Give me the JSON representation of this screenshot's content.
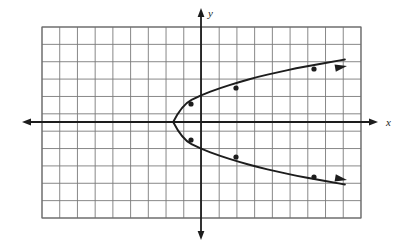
{
  "figure": {
    "background_color": "#ffffff",
    "grid": {
      "left": 42,
      "top": 27,
      "right": 361,
      "bottom": 218,
      "cell_size": 17.72,
      "columns": 18,
      "rows": 11,
      "line_color": "#7a7a7a",
      "line_width": 0.9,
      "border_color": "#6a6a6a",
      "border_width": 1.1,
      "visible": true
    },
    "axes": {
      "x_axis": {
        "label": "x",
        "label_x": 386,
        "label_y": 126,
        "y_pixel": 122,
        "start_x": 22,
        "end_x": 378,
        "color": "#1d1d1d",
        "line_width": 1.8,
        "arrow_left": true,
        "arrow_right": true
      },
      "y_axis": {
        "label": "y",
        "label_x": 208,
        "label_y": 17,
        "x_pixel": 201,
        "start_y": 8,
        "end_y": 240,
        "color": "#1d1d1d",
        "line_width": 1.8,
        "arrow_up": true,
        "arrow_down": true
      },
      "origin_pixel": [
        201,
        122
      ]
    }
  },
  "chart_data": {
    "type": "line",
    "xlabel": "x",
    "ylabel": "y",
    "grid": true,
    "legend": false,
    "curve_color": "#1d1d1d",
    "curve_width": 1.9,
    "vertex_pixel": [
      173,
      122
    ],
    "vertex_data": [
      -1.57,
      0
    ],
    "axis_of_symmetry": "y = 0",
    "opens": "right",
    "x": [
      -1.57,
      -1.07,
      0.0,
      1.06,
      2.15,
      3.21,
      4.29,
      5.37,
      6.46,
      7.57,
      8.12
    ],
    "y_upper": [
      0.0,
      1.0,
      1.55,
      1.95,
      2.3,
      2.6,
      2.85,
      3.1,
      3.3,
      3.5,
      3.6
    ],
    "y_lower": [
      0.0,
      -1.0,
      -1.55,
      -1.95,
      -2.3,
      -2.6,
      -2.85,
      -3.1,
      -3.3,
      -3.5,
      -3.6
    ],
    "marked_points_pixel": [
      [
        191,
        104
      ],
      [
        236,
        88
      ],
      [
        314,
        69
      ],
      [
        191,
        140
      ],
      [
        236,
        157
      ],
      [
        314,
        177
      ]
    ],
    "marked_points_data": [
      [
        -0.56,
        1.02
      ],
      [
        1.97,
        1.92
      ],
      [
        6.38,
        2.99
      ],
      [
        -0.56,
        -1.02
      ],
      [
        1.97,
        -1.92
      ],
      [
        6.38,
        -2.99
      ]
    ],
    "marked_point_radius": 2.6,
    "marked_point_color": "#1d1d1d",
    "upper_arrow_tip_pixel": [
      347,
      66
    ],
    "lower_arrow_tip_pixel": [
      347,
      180
    ],
    "xlim": [
      -8.98,
      9.03
    ],
    "ylim": [
      -5.41,
      5.36
    ]
  }
}
